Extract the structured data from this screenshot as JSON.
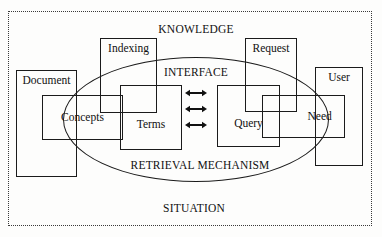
{
  "diagram": {
    "captions": [
      {
        "id": "knowledge",
        "text": "KNOWLEDGE",
        "x": 196,
        "y": 30
      },
      {
        "id": "interface",
        "text": "INTERFACE",
        "x": 196,
        "y": 73
      },
      {
        "id": "retrieval_mechanism",
        "text": "RETRIEVAL MECHANISM",
        "x": 200,
        "y": 166
      },
      {
        "id": "situation",
        "text": "SITUATION",
        "x": 194,
        "y": 209
      }
    ],
    "boxes": [
      {
        "id": "document",
        "label": "Document",
        "x": 16,
        "y": 70,
        "w": 61,
        "h": 107,
        "label_pos": "top"
      },
      {
        "id": "concepts",
        "label": "Concepts",
        "x": 42,
        "y": 95,
        "w": 81,
        "h": 45,
        "label_pos": "mid"
      },
      {
        "id": "indexing",
        "label": "Indexing",
        "x": 100,
        "y": 38,
        "w": 57,
        "h": 75,
        "label_pos": "top"
      },
      {
        "id": "terms",
        "label": "Terms",
        "x": 120,
        "y": 85,
        "w": 62,
        "h": 65,
        "label_pos": "mid"
      },
      {
        "id": "query",
        "label": "Query",
        "x": 217,
        "y": 85,
        "w": 63,
        "h": 62,
        "label_pos": "mid"
      },
      {
        "id": "request",
        "label": "Request",
        "x": 245,
        "y": 38,
        "w": 52,
        "h": 74,
        "label_pos": "top"
      },
      {
        "id": "need",
        "label": "Need",
        "x": 262,
        "y": 95,
        "w": 83,
        "h": 43,
        "label_pos": "mid"
      },
      {
        "id": "user",
        "label": "User",
        "x": 315,
        "y": 67,
        "w": 48,
        "h": 99,
        "label_pos": "top"
      }
    ],
    "ellipse": {
      "id": "retrieval-mechanism-ellipse",
      "cx": 196,
      "cy": 119,
      "rx": 133,
      "ry": 62
    },
    "situation_frame": {
      "id": "situation-frame",
      "x": 8,
      "y": 11,
      "w": 364,
      "h": 215,
      "stroke": "dotted"
    },
    "arrows": [
      {
        "id": "arrow-1",
        "x": 196,
        "y": 93,
        "kind": "double-headed"
      },
      {
        "id": "arrow-2",
        "x": 196,
        "y": 109,
        "kind": "double-headed"
      },
      {
        "id": "arrow-3",
        "x": 196,
        "y": 125,
        "kind": "double-headed"
      }
    ],
    "colors": {
      "stroke": "#1b1b1b",
      "text": "#101010",
      "background": "#fdfdfc",
      "frame": "#3a3a3a"
    }
  }
}
